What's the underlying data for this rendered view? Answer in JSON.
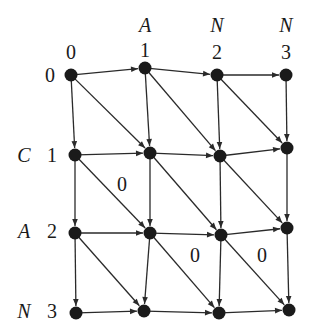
{
  "diagram": {
    "type": "alignment-grid-graph",
    "column_letters": [
      "",
      "A",
      "N",
      "N"
    ],
    "column_indices": [
      "0",
      "1",
      "2",
      "3"
    ],
    "row_letters": [
      "",
      "C",
      "A",
      "N"
    ],
    "row_indices": [
      "0",
      "1",
      "2",
      "3"
    ],
    "nodes": [
      [
        [
          71,
          75
        ],
        [
          145,
          68
        ],
        [
          217,
          75
        ],
        [
          286,
          75
        ]
      ],
      [
        [
          75,
          155
        ],
        [
          150,
          153
        ],
        [
          220,
          156
        ],
        [
          287,
          148
        ]
      ],
      [
        [
          75,
          233
        ],
        [
          150,
          233
        ],
        [
          221,
          235
        ],
        [
          287,
          228
        ]
      ],
      [
        [
          76,
          313
        ],
        [
          144,
          311
        ],
        [
          219,
          313
        ],
        [
          289,
          310
        ]
      ]
    ],
    "edge_labels": [
      {
        "text": "0",
        "x": 122,
        "y": 191
      },
      {
        "text": "0",
        "x": 195,
        "y": 262
      },
      {
        "text": "0",
        "x": 262,
        "y": 262
      }
    ],
    "colors": {
      "node": "#1a1a1a",
      "edge": "#2a2a2a",
      "background": "#ffffff"
    }
  }
}
